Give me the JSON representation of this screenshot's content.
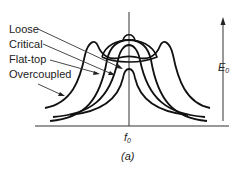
{
  "figure": {
    "caption": "(a)",
    "legend_labels": [
      {
        "name": "loose",
        "text": "Loose"
      },
      {
        "name": "critical",
        "text": "Critical"
      },
      {
        "name": "flat-top",
        "text": "Flat-top"
      },
      {
        "name": "overcoupled",
        "text": "Overcoupled"
      }
    ],
    "x_axis_label": {
      "main": "f",
      "sub": "0"
    },
    "y_axis_label": {
      "main": "E",
      "sub": "0"
    }
  },
  "colors": {
    "stroke": "#111111",
    "axis": "#333333",
    "background": "#ffffff"
  }
}
